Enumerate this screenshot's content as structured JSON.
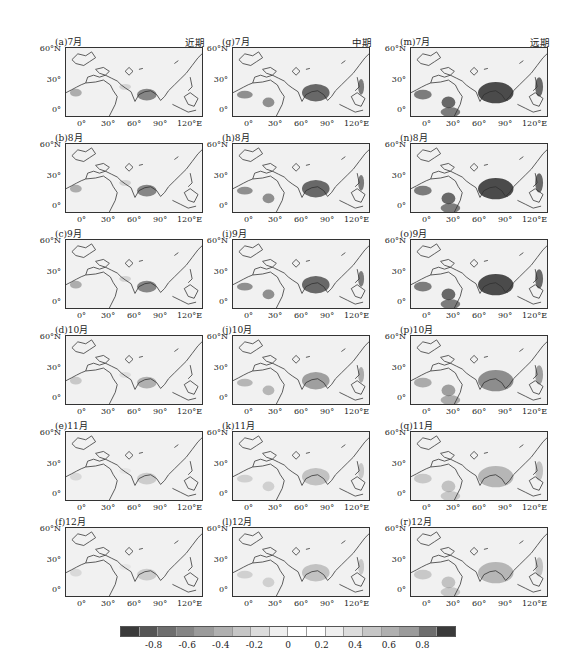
{
  "figure": {
    "columns": [
      {
        "period": "近期",
        "panels": [
          {
            "label": "(a)7月",
            "intensity": "low"
          },
          {
            "label": "(b)8月",
            "intensity": "low"
          },
          {
            "label": "(c)9月",
            "intensity": "low"
          },
          {
            "label": "(d)10月",
            "intensity": "low"
          },
          {
            "label": "(e)11月",
            "intensity": "low"
          },
          {
            "label": "(f)12月",
            "intensity": "low"
          }
        ]
      },
      {
        "period": "中期",
        "panels": [
          {
            "label": "(g)7月",
            "intensity": "mid"
          },
          {
            "label": "(h)8月",
            "intensity": "mid"
          },
          {
            "label": "(i)9月",
            "intensity": "mid"
          },
          {
            "label": "(j)10月",
            "intensity": "mid"
          },
          {
            "label": "(k)11月",
            "intensity": "mid"
          },
          {
            "label": "(l)12月",
            "intensity": "mid"
          }
        ]
      },
      {
        "period": "远期",
        "panels": [
          {
            "label": "(m)7月",
            "intensity": "high"
          },
          {
            "label": "(n)8月",
            "intensity": "high"
          },
          {
            "label": "(o)9月",
            "intensity": "high"
          },
          {
            "label": "(p)10月",
            "intensity": "high"
          },
          {
            "label": "(q)11月",
            "intensity": "high"
          },
          {
            "label": "(r)12月",
            "intensity": "high"
          }
        ]
      }
    ],
    "y_ticks": [
      "60°N",
      "30°",
      "0°"
    ],
    "x_ticks": [
      "0°",
      "30°",
      "60°",
      "90°",
      "120°E"
    ],
    "colorbar": {
      "ticks": [
        "-0.8",
        "-0.6",
        "-0.4",
        "-0.2",
        "0",
        "0.2",
        "0.4",
        "0.6",
        "0.8"
      ],
      "colors": [
        "#3a3a3a",
        "#555555",
        "#6e6e6e",
        "#858585",
        "#9b9b9b",
        "#b0b0b0",
        "#c6c6c6",
        "#dcdcdc",
        "#efefef",
        "#ffffff",
        "#ffffff",
        "#efefef",
        "#dcdcdc",
        "#c6c6c6",
        "#b0b0b0",
        "#9b9b9b",
        "#6e6e6e",
        "#3a3a3a"
      ]
    }
  },
  "chart_data": {
    "type": "heatmap",
    "title": "",
    "panels": [
      "(a)7月",
      "(b)8月",
      "(c)9月",
      "(d)10月",
      "(e)11月",
      "(f)12月",
      "(g)7月",
      "(h)8月",
      "(i)9月",
      "(j)10月",
      "(k)11月",
      "(l)12月",
      "(m)7月",
      "(n)8月",
      "(o)9月",
      "(p)10月",
      "(q)11月",
      "(r)12月"
    ],
    "column_titles": [
      "近期",
      "中期",
      "远期"
    ],
    "row_titles": [
      "7月",
      "8月",
      "9月",
      "10月",
      "11月",
      "12月"
    ],
    "xlabel": "",
    "ylabel": "",
    "x_ticks": [
      "0°",
      "30°",
      "60°",
      "90°",
      "120°E"
    ],
    "y_ticks": [
      "60°N",
      "30°",
      "0°"
    ],
    "xlim": [
      -20,
      145
    ],
    "ylim": [
      -10,
      65
    ],
    "colorbar": {
      "min": -0.8,
      "max": 0.8,
      "ticks": [
        -0.8,
        -0.6,
        -0.4,
        -0.2,
        0,
        0.2,
        0.4,
        0.6,
        0.8
      ],
      "orientation": "horizontal",
      "position": "bottom"
    },
    "grid": false,
    "legend": "colorbar bottom"
  }
}
